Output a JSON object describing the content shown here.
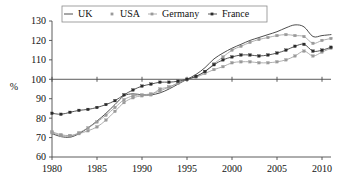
{
  "chart_data": {
    "type": "line",
    "title": "",
    "xlabel": "",
    "ylabel": "%",
    "xlim": [
      1980,
      2011
    ],
    "ylim": [
      60,
      130
    ],
    "xticks": [
      1980,
      1985,
      1990,
      1995,
      2000,
      2005,
      2010
    ],
    "yticks": [
      60,
      70,
      80,
      90,
      100,
      110,
      120,
      130
    ],
    "grid": false,
    "legend_position": "top-center",
    "reference_line": 100,
    "x": [
      1980,
      1981,
      1982,
      1983,
      1984,
      1985,
      1986,
      1987,
      1988,
      1989,
      1990,
      1991,
      1992,
      1993,
      1994,
      1995,
      1996,
      1997,
      1998,
      1999,
      2000,
      2001,
      2002,
      2003,
      2004,
      2005,
      2006,
      2007,
      2008,
      2009,
      2010,
      2011
    ],
    "series": [
      {
        "name": "UK",
        "color": "#3a3a3a",
        "marker": "none",
        "values": [
          72.0,
          70.5,
          70.2,
          72.0,
          75.0,
          78.5,
          82.5,
          87.0,
          91.5,
          92.5,
          92.0,
          92.0,
          93.0,
          95.0,
          97.5,
          100.0,
          102.5,
          106.0,
          110.5,
          113.5,
          116.0,
          118.0,
          120.0,
          121.5,
          123.0,
          124.5,
          126.5,
          128.0,
          127.0,
          122.0,
          122.5,
          123.0
        ]
      },
      {
        "name": "USA",
        "color": "#9a9a9a",
        "marker": "square",
        "values": [
          73.0,
          71.5,
          71.0,
          72.0,
          73.5,
          75.5,
          79.0,
          83.5,
          88.0,
          90.5,
          91.5,
          92.0,
          95.0,
          96.0,
          98.0,
          100.0,
          101.5,
          104.0,
          108.0,
          111.5,
          115.0,
          117.0,
          119.0,
          120.5,
          121.5,
          122.5,
          123.0,
          122.5,
          122.0,
          118.5,
          120.0,
          121.0
        ]
      },
      {
        "name": "Germany",
        "color": "#9a9a9a",
        "marker": "square",
        "values": [
          72.5,
          71.0,
          70.8,
          72.5,
          75.0,
          78.0,
          81.5,
          85.5,
          89.5,
          91.5,
          92.0,
          92.5,
          94.0,
          96.0,
          98.0,
          100.0,
          101.0,
          103.0,
          105.0,
          106.5,
          108.5,
          109.0,
          109.0,
          108.5,
          108.5,
          109.0,
          110.0,
          112.0,
          114.5,
          112.0,
          114.0,
          116.0
        ]
      },
      {
        "name": "France",
        "color": "#2b2b2b",
        "marker": "square",
        "values": [
          82.5,
          82.0,
          83.0,
          84.0,
          84.5,
          85.5,
          87.0,
          89.0,
          92.0,
          94.5,
          96.5,
          97.5,
          98.5,
          98.5,
          99.0,
          100.0,
          101.5,
          104.0,
          107.5,
          110.0,
          111.5,
          112.5,
          112.5,
          112.0,
          112.5,
          113.5,
          115.0,
          117.0,
          118.0,
          114.5,
          115.0,
          116.5
        ]
      }
    ]
  },
  "legend": {
    "items": [
      {
        "label": "UK",
        "marker": "line"
      },
      {
        "label": "USA",
        "marker": "point"
      },
      {
        "label": "Germany",
        "marker": "point-line"
      },
      {
        "label": "France",
        "marker": "point-line"
      }
    ]
  },
  "axes": {
    "y_label": "%",
    "y_tick_labels": [
      "130",
      "120",
      "110",
      "100",
      "90",
      "80",
      "70",
      "60"
    ],
    "x_tick_labels": [
      "1980",
      "1985",
      "1990",
      "1995",
      "2000",
      "2005",
      "2010"
    ]
  }
}
